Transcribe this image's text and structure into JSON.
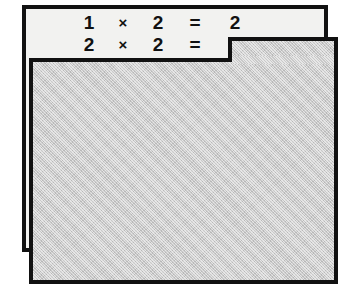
{
  "worksheet": {
    "title": "Multiplication practice",
    "problems": [
      {
        "operand_a": "1",
        "operator": "×",
        "operand_b": "2",
        "equals": "=",
        "answer": "2",
        "answer_visible": true
      },
      {
        "operand_a": "2",
        "operator": "×",
        "operand_b": "2",
        "equals": "=",
        "answer": "",
        "answer_visible": false
      }
    ]
  },
  "cover": {
    "label": "answer-cover-panel",
    "state": "covering"
  },
  "colors": {
    "card_background": "#f2f2f0",
    "cover_background": "#c9c9c9",
    "border": "#111111",
    "text": "#111111",
    "page_background": "#ffffff"
  }
}
